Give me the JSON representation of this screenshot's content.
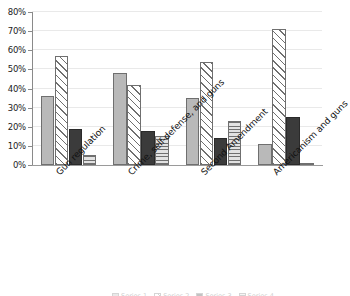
{
  "chart_data": {
    "type": "bar",
    "title": "",
    "subtitle": "",
    "xlabel": "",
    "ylabel": "",
    "ylim": [
      0,
      80
    ],
    "y_tick_values": [
      0,
      10,
      20,
      30,
      40,
      50,
      60,
      70,
      80
    ],
    "y_tick_labels": [
      "0%",
      "10%",
      "20%",
      "30%",
      "40%",
      "50%",
      "60%",
      "70%",
      "80%"
    ],
    "grid": true,
    "grid_axis": "y",
    "legend_position": "bottom",
    "legend_visible_partially": true,
    "categories": [
      "Gun regulation",
      "Crime, self-defense, and guns",
      "Second Amendment",
      "Americanism and guns"
    ],
    "series": [
      {
        "name": "Series 1",
        "style": "solid-light",
        "color": "#b9b9b9",
        "values": [
          36,
          48,
          35,
          11
        ]
      },
      {
        "name": "Series 2",
        "style": "hatch-diagonal",
        "color": "#ffffff",
        "values": [
          57,
          42,
          54,
          71
        ]
      },
      {
        "name": "Series 3",
        "style": "solid-dark",
        "color": "#3b3b3b",
        "values": [
          19,
          18,
          14,
          25
        ]
      },
      {
        "name": "Series 4",
        "style": "hatch-horizontal",
        "color": "#e2e2e2",
        "values": [
          5,
          15,
          23,
          1
        ]
      }
    ]
  },
  "axis": {
    "y_ticks": [
      {
        "label": "80%",
        "value": 80
      },
      {
        "label": "70%",
        "value": 70
      },
      {
        "label": "60%",
        "value": 60
      },
      {
        "label": "50%",
        "value": 50
      },
      {
        "label": "40%",
        "value": 40
      },
      {
        "label": "30%",
        "value": 30
      },
      {
        "label": "20%",
        "value": 20
      },
      {
        "label": "10%",
        "value": 10
      },
      {
        "label": "0%",
        "value": 0
      }
    ]
  },
  "legend": {
    "items": [
      {
        "label": "Series 1"
      },
      {
        "label": "Series 2"
      },
      {
        "label": "Series 3"
      },
      {
        "label": "Series 4"
      }
    ]
  }
}
